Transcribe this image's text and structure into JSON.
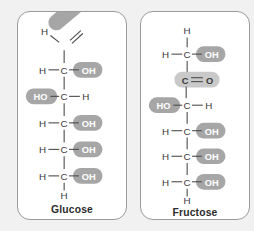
{
  "figure": {
    "background_color": "#f1f1f1",
    "panel_background": "#ffffff",
    "panel_border_color": "#9b9b9b",
    "highlight_color": "#a6a6a6",
    "highlight_light_color": "#c9c9c9",
    "bond_color": "#4a4a4a",
    "atom_text_color": "#3a3a3a",
    "highlight_text_color": "#ffffff"
  },
  "panels": [
    {
      "id": "glucose",
      "caption": "Glucose",
      "functional_group": "aldehyde",
      "rows": [
        {
          "left": "H",
          "center": "C",
          "right": "O",
          "right_bond": "double",
          "highlighted": "center-right",
          "orientation": "angled"
        },
        {
          "left": "H",
          "center": "C",
          "right": "OH",
          "right_bond": "single",
          "highlighted": "right"
        },
        {
          "left": "HO",
          "center": "C",
          "right": "H",
          "right_bond": "single",
          "highlighted": "left"
        },
        {
          "left": "H",
          "center": "C",
          "right": "OH",
          "right_bond": "single",
          "highlighted": "right"
        },
        {
          "left": "H",
          "center": "C",
          "right": "OH",
          "right_bond": "single",
          "highlighted": "right"
        },
        {
          "left": "H",
          "center": "C",
          "right": "OH",
          "right_bond": "single",
          "highlighted": "right"
        }
      ],
      "terminal_bottom": "H",
      "terminal_top": ""
    },
    {
      "id": "fructose",
      "caption": "Fructose",
      "functional_group": "ketone",
      "rows": [
        {
          "left": "H",
          "center": "C",
          "right": "OH",
          "right_bond": "single",
          "highlighted": "right"
        },
        {
          "left": "",
          "center": "C",
          "right": "O",
          "right_bond": "double",
          "highlighted": "center-right"
        },
        {
          "left": "HO",
          "center": "C",
          "right": "H",
          "right_bond": "single",
          "highlighted": "left"
        },
        {
          "left": "H",
          "center": "C",
          "right": "OH",
          "right_bond": "single",
          "highlighted": "right"
        },
        {
          "left": "H",
          "center": "C",
          "right": "OH",
          "right_bond": "single",
          "highlighted": "right"
        },
        {
          "left": "H",
          "center": "C",
          "right": "OH",
          "right_bond": "single",
          "highlighted": "right"
        }
      ],
      "terminal_bottom": "H",
      "terminal_top": "H"
    }
  ]
}
